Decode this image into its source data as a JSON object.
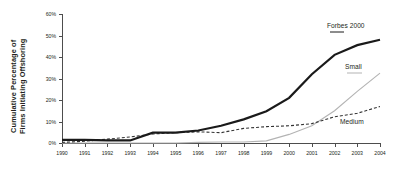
{
  "chart_data": {
    "type": "line",
    "title": "",
    "xlabel": "",
    "ylabel": "Cumulative Percentage of Firms Initiating Offshoring",
    "ylabel_line1": "Cumulative Percentage of",
    "ylabel_line2": "Firms Initiating Offshoring",
    "x": [
      1990,
      1991,
      1992,
      1993,
      1994,
      1995,
      1996,
      1997,
      1998,
      1999,
      2000,
      2001,
      2002,
      2003,
      2004
    ],
    "categories": [
      "1990",
      "1991",
      "1992",
      "1993",
      "1994",
      "1995",
      "1996",
      "1997",
      "1998",
      "1999",
      "2000",
      "2001",
      "2002",
      "2003",
      "2004"
    ],
    "ylim": [
      0,
      60
    ],
    "yticks": [
      0,
      10,
      20,
      30,
      40,
      50,
      60
    ],
    "ytick_labels": [
      "0%",
      "10%",
      "20%",
      "30%",
      "40%",
      "50%",
      "60%"
    ],
    "xlim": [
      1990,
      2004
    ],
    "grid": false,
    "legend_position": "inline-annotations",
    "series": [
      {
        "name": "Forbes 2000",
        "style": "solid-thick",
        "color": "#1a1a1a",
        "values": [
          1.5,
          1.5,
          1.2,
          1.2,
          4.8,
          4.8,
          5.8,
          8.0,
          11.0,
          14.8,
          21.0,
          32.0,
          41.0,
          45.5,
          48.0
        ]
      },
      {
        "name": "Small",
        "style": "solid-thin",
        "color": "#b3b3b3",
        "values": [
          0.0,
          0.0,
          0.0,
          0.0,
          0.0,
          0.0,
          0.3,
          0.5,
          0.5,
          1.0,
          4.0,
          8.0,
          15.0,
          24.0,
          32.5
        ]
      },
      {
        "name": "Medium",
        "style": "dashed",
        "color": "#333333",
        "values": [
          0.3,
          0.8,
          1.8,
          2.8,
          4.2,
          4.8,
          5.2,
          4.8,
          6.8,
          7.6,
          8.0,
          9.0,
          12.2,
          13.8,
          17.0
        ]
      }
    ],
    "annotations": [
      {
        "text": "Forbes 2000",
        "series": "Forbes 2000"
      },
      {
        "text": "Small",
        "series": "Small"
      },
      {
        "text": "Medium",
        "series": "Medium"
      }
    ]
  }
}
